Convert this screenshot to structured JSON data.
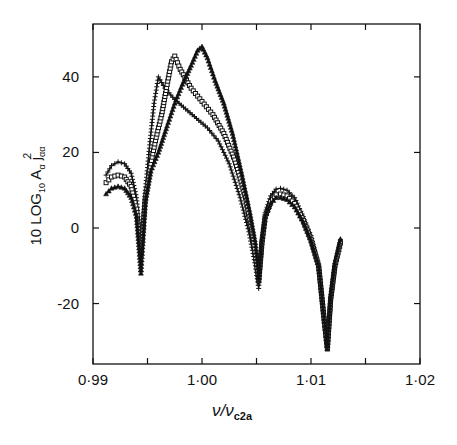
{
  "chart_data": {
    "type": "line",
    "title": "",
    "xlabel": "ν/ν_c2a",
    "xlabel_main": "ν/ν",
    "xlabel_sub": "c2a",
    "ylabel": "10 LOG10 Aα jαα²",
    "ylabel_parts": {
      "prefix": "10 LOG",
      "sub1": "10",
      "mid": " A",
      "sub2": "α",
      "j": " j",
      "sub3": "αα",
      "sup": "2"
    },
    "xlim": [
      0.99,
      1.02
    ],
    "ylim": [
      -36,
      54
    ],
    "xticks": [
      0.99,
      0.995,
      1.0,
      1.005,
      1.01,
      1.015,
      1.02
    ],
    "xtick_labels": [
      {
        "value": 0.99,
        "label": "0·99"
      },
      {
        "value": 1.0,
        "label": "1·00"
      },
      {
        "value": 1.01,
        "label": "1·01"
      },
      {
        "value": 1.02,
        "label": "1·02"
      }
    ],
    "yticks": [
      -20,
      0,
      20,
      40
    ],
    "ytick_labels": [
      {
        "value": 40,
        "label": "40"
      },
      {
        "value": 20,
        "label": "20"
      },
      {
        "value": 0,
        "label": "0"
      },
      {
        "value": -20,
        "label": "-20"
      }
    ],
    "grid": false,
    "legend": null,
    "series": [
      {
        "name": "plus-markers",
        "marker": "plus",
        "x": [
          0.9912,
          0.9917,
          0.9923,
          0.9929,
          0.9935,
          0.994,
          0.9944,
          0.9948,
          0.9952,
          0.9956,
          0.996,
          0.9966,
          0.9975,
          0.9985,
          0.9995,
          1.0005,
          1.0015,
          1.0025,
          1.0035,
          1.0043,
          1.0049,
          1.0052,
          1.0055,
          1.0058,
          1.0063,
          1.0068,
          1.0072,
          1.0078,
          1.0085,
          1.0093,
          1.01,
          1.0107,
          1.0112,
          1.0115,
          1.0118,
          1.0122,
          1.0127
        ],
        "y": [
          14,
          16.5,
          17.5,
          17,
          14.5,
          8,
          -7,
          10,
          22,
          33,
          40,
          37,
          34,
          31.5,
          29,
          26.5,
          23,
          17,
          8,
          -1,
          -10,
          -16,
          -3,
          4,
          8.5,
          10.3,
          10.5,
          10,
          8,
          3,
          -2,
          -10,
          -25,
          -31,
          -19,
          -10,
          -3
        ]
      },
      {
        "name": "square-markers",
        "marker": "square",
        "x": [
          0.9912,
          0.9917,
          0.9923,
          0.9929,
          0.9935,
          0.994,
          0.9944,
          0.9948,
          0.9953,
          0.9958,
          0.9963,
          0.9968,
          0.9972,
          0.9975,
          0.998,
          0.999,
          1.0,
          1.001,
          1.002,
          1.003,
          1.004,
          1.0047,
          1.0052,
          1.0055,
          1.0058,
          1.0063,
          1.0068,
          1.0072,
          1.0078,
          1.0085,
          1.0093,
          1.01,
          1.0107,
          1.0112,
          1.0115,
          1.0118,
          1.0122,
          1.0127
        ],
        "y": [
          12,
          13.5,
          14,
          13.5,
          11,
          5,
          -7,
          8,
          17,
          24,
          30,
          38,
          44,
          45.5,
          42,
          37,
          33.5,
          30,
          25,
          18,
          8,
          -3,
          -14,
          -4,
          3,
          7,
          8.8,
          9,
          8.5,
          6.5,
          2,
          -3,
          -10,
          -24,
          -32,
          -19,
          -10,
          -4
        ]
      },
      {
        "name": "triangle-markers",
        "marker": "triangle",
        "x": [
          0.9912,
          0.9917,
          0.9923,
          0.9929,
          0.9935,
          0.994,
          0.9944,
          0.9948,
          0.9953,
          0.996,
          0.9968,
          0.9975,
          0.9982,
          0.999,
          0.9996,
          1.0,
          1.0005,
          1.0012,
          1.002,
          1.0028,
          1.0036,
          1.0044,
          1.0049,
          1.0052,
          1.0055,
          1.0058,
          1.0063,
          1.0068,
          1.0072,
          1.0078,
          1.0085,
          1.0093,
          1.01,
          1.0107,
          1.0112,
          1.0115,
          1.0118,
          1.0122,
          1.0127
        ],
        "y": [
          9,
          10.5,
          11,
          10.5,
          8,
          3,
          -12,
          7,
          15,
          20,
          27,
          33,
          38,
          43,
          47,
          48,
          45,
          39,
          33,
          25,
          15,
          4,
          -4,
          -14,
          -3,
          3,
          6.5,
          8,
          8,
          7.5,
          5.5,
          1.5,
          -3.5,
          -10,
          -24,
          -32,
          -18,
          -9,
          -3
        ]
      }
    ]
  }
}
